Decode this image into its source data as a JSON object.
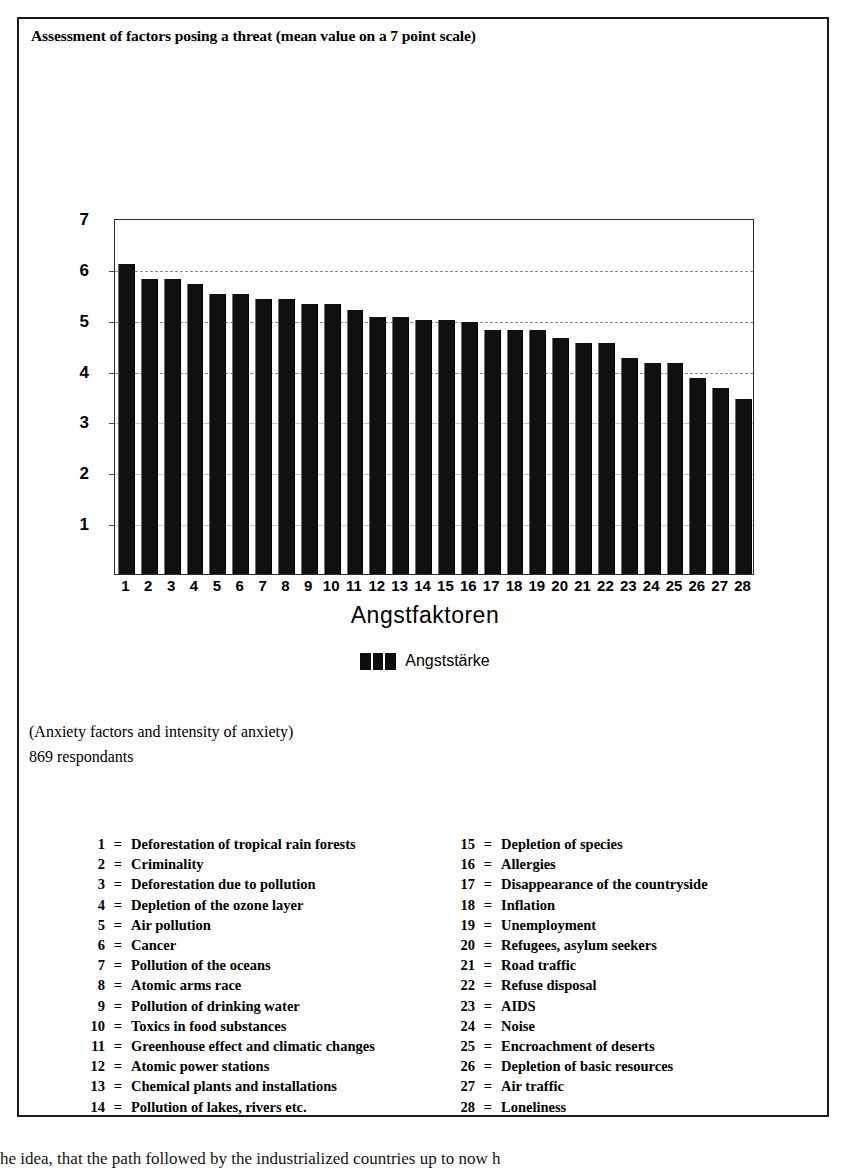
{
  "figure": {
    "title": "Assessment of factors posing a threat (mean value on a 7 point scale)",
    "caption_line_1": "(Anxiety factors and intensity of anxiety)",
    "caption_line_2": "869 respondants"
  },
  "chart_data": {
    "type": "bar",
    "title": "Assessment of factors posing a threat (mean value on a 7 point scale)",
    "xlabel": "Angstfaktoren",
    "ylabel": "",
    "ylim": [
      0,
      7
    ],
    "yticks": [
      1,
      2,
      3,
      4,
      5,
      6,
      7
    ],
    "grid": true,
    "legend_position": "bottom-center",
    "series": [
      {
        "name": "Angststärke",
        "color": "#101010",
        "values": [
          6.1,
          5.8,
          5.8,
          5.7,
          5.5,
          5.5,
          5.4,
          5.4,
          5.3,
          5.3,
          5.2,
          5.05,
          5.05,
          5.0,
          5.0,
          4.95,
          4.8,
          4.8,
          4.8,
          4.65,
          4.55,
          4.55,
          4.25,
          4.15,
          4.15,
          3.85,
          3.65,
          3.45
        ]
      }
    ],
    "categories": [
      "1",
      "2",
      "3",
      "4",
      "5",
      "6",
      "7",
      "8",
      "9",
      "10",
      "11",
      "12",
      "13",
      "14",
      "15",
      "16",
      "17",
      "18",
      "19",
      "20",
      "21",
      "22",
      "23",
      "24",
      "25",
      "26",
      "27",
      "28"
    ]
  },
  "key": {
    "left_column": [
      {
        "num": "1",
        "eq": "=",
        "text": "Deforestation of tropical rain forests"
      },
      {
        "num": "2",
        "eq": "=",
        "text": "Criminality"
      },
      {
        "num": "3",
        "eq": "=",
        "text": "Deforestation due to pollution"
      },
      {
        "num": "4",
        "eq": "=",
        "text": "Depletion of the ozone layer"
      },
      {
        "num": "5",
        "eq": "=",
        "text": "Air pollution"
      },
      {
        "num": "6",
        "eq": "=",
        "text": "Cancer"
      },
      {
        "num": "7",
        "eq": "=",
        "text": "Pollution of the oceans"
      },
      {
        "num": "8",
        "eq": "=",
        "text": "Atomic arms race"
      },
      {
        "num": "9",
        "eq": "=",
        "text": "Pollution of drinking water"
      },
      {
        "num": "10",
        "eq": "=",
        "text": "Toxics in food substances"
      },
      {
        "num": "11",
        "eq": "=",
        "text": "Greenhouse effect and climatic changes"
      },
      {
        "num": "12",
        "eq": "=",
        "text": "Atomic power stations"
      },
      {
        "num": "13",
        "eq": "=",
        "text": "Chemical plants and installations"
      },
      {
        "num": "14",
        "eq": "=",
        "text": "Pollution of lakes, rivers etc."
      }
    ],
    "right_column": [
      {
        "num": "15",
        "eq": "=",
        "text": "Depletion of species"
      },
      {
        "num": "16",
        "eq": "=",
        "text": "Allergies"
      },
      {
        "num": "17",
        "eq": "=",
        "text": "Disappearance of the countryside"
      },
      {
        "num": "18",
        "eq": "=",
        "text": "Inflation"
      },
      {
        "num": "19",
        "eq": "=",
        "text": "Unemployment"
      },
      {
        "num": "20",
        "eq": "=",
        "text": "Refugees, asylum seekers"
      },
      {
        "num": "21",
        "eq": "=",
        "text": "Road traffic"
      },
      {
        "num": "22",
        "eq": "=",
        "text": "Refuse disposal"
      },
      {
        "num": "23",
        "eq": "=",
        "text": "AIDS"
      },
      {
        "num": "24",
        "eq": "=",
        "text": "Noise"
      },
      {
        "num": "25",
        "eq": "=",
        "text": "Encroachment of deserts"
      },
      {
        "num": "26",
        "eq": "=",
        "text": "Depletion of basic resources"
      },
      {
        "num": "27",
        "eq": "=",
        "text": "Air traffic"
      },
      {
        "num": "28",
        "eq": "=",
        "text": "Loneliness"
      }
    ]
  },
  "body_text": {
    "line_1": "he idea, that the path followed by the industrialized countries up to now h"
  }
}
